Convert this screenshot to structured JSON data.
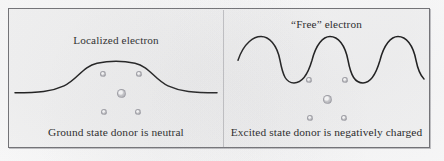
{
  "figure": {
    "frame_color": "#6f6f73",
    "background_color": "#f6f6f6",
    "curve_color": "#141414"
  },
  "panels": [
    {
      "id": "ground-state",
      "caption_top": "Localized electron",
      "caption_bottom": "Ground state donor is neutral",
      "curve_kind": "localized-bump",
      "dot_count": 5
    },
    {
      "id": "excited-state",
      "caption_top": "“Free” electron",
      "caption_bottom": "Excited state donor is negatively charged",
      "curve_kind": "oscillating-wave",
      "wave_cycles": 5,
      "dot_count": 5
    }
  ],
  "dots": {
    "layout": "four-corners-plus-center",
    "color": "#c8c8cc"
  }
}
